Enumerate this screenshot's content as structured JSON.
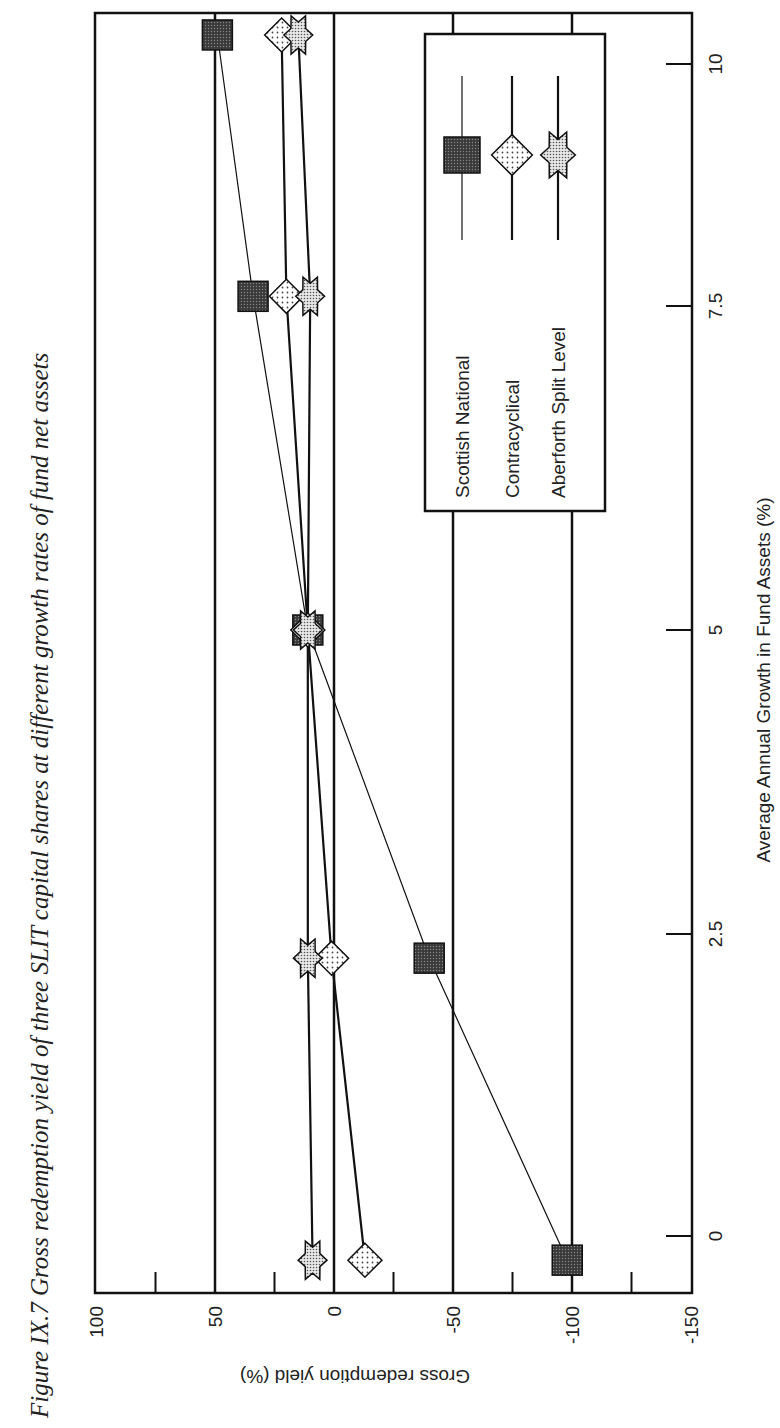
{
  "chart_data": {
    "type": "line",
    "title": "Figure IX.7  Gross redemption yield of three SLIT capital shares at different growth rates of fund net assets",
    "xlabel": "Average Annual Growth in Fund Assets (%)",
    "ylabel": "Gross redemption yield (%)",
    "xlim": [
      -0.5,
      10.5
    ],
    "ylim": [
      -150,
      100
    ],
    "x_ticks": [
      0,
      2.5,
      5,
      7.5,
      10
    ],
    "x_tick_labels": [
      "0",
      "2.5",
      "5",
      "7.5",
      "10"
    ],
    "y_ticks": [
      100,
      50,
      0,
      -50,
      -100,
      -150
    ],
    "y_tick_labels": [
      "100",
      "50",
      "0",
      "-50",
      "-100",
      "-150"
    ],
    "y_minor_ticks": [
      75,
      25,
      -25,
      -75,
      -125
    ],
    "y_gridlines": [
      50,
      0,
      -50,
      -100
    ],
    "grid": true,
    "orientation": "rotated 90° counter-clockwise",
    "legend_position": "upper right (inside plot)",
    "series": [
      {
        "name": "Scottish National",
        "marker": "square",
        "color": "#555555",
        "x": [
          -0.2,
          2.3,
          5.0,
          7.6,
          10.3
        ],
        "values": [
          -98,
          -40,
          11,
          34,
          49
        ]
      },
      {
        "name": "Contracyclical",
        "marker": "diamond",
        "color": "#dddddd",
        "x": [
          -0.2,
          2.3,
          5.0,
          7.6,
          10.3
        ],
        "values": [
          -13,
          1,
          11,
          20,
          22
        ]
      },
      {
        "name": "Aberforth Split Level",
        "marker": "star",
        "color": "#bbbbbb",
        "x": [
          -0.2,
          2.3,
          5.0,
          7.6,
          10.3
        ],
        "values": [
          9,
          11,
          11,
          10,
          15
        ]
      }
    ]
  },
  "figure": {
    "title": "Figure IX.7  Gross redemption yield of three SLIT capital shares at different growth rates of fund net assets"
  },
  "legend": {
    "items": [
      "Scottish National",
      "Contracyclical",
      "Aberforth Split Level"
    ]
  }
}
